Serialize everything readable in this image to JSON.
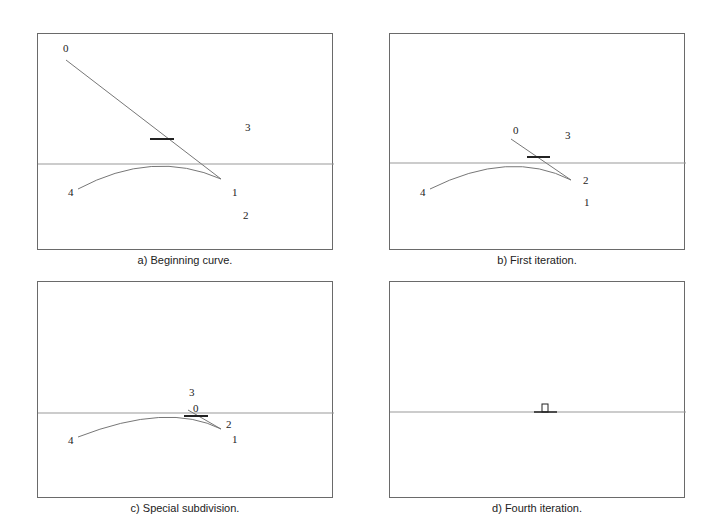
{
  "figure": {
    "panels": [
      {
        "id": "a",
        "caption": "a)  Beginning curve.",
        "labels": [
          {
            "text": "0",
            "x": 25,
            "y": 9
          },
          {
            "text": "3",
            "x": 207,
            "y": 88
          },
          {
            "text": "4",
            "x": 30,
            "y": 153
          },
          {
            "text": "1",
            "x": 194,
            "y": 153
          },
          {
            "text": "2",
            "x": 205,
            "y": 176
          }
        ]
      },
      {
        "id": "b",
        "caption": "b)  First iteration.",
        "labels": [
          {
            "text": "0",
            "x": 123,
            "y": 91
          },
          {
            "text": "3",
            "x": 175,
            "y": 96
          },
          {
            "text": "2",
            "x": 193,
            "y": 141
          },
          {
            "text": "4",
            "x": 30,
            "y": 153
          },
          {
            "text": "1",
            "x": 194,
            "y": 163
          }
        ]
      },
      {
        "id": "c",
        "caption": "c)  Special subdivision.",
        "labels": [
          {
            "text": "3",
            "x": 151,
            "y": 105
          },
          {
            "text": "0",
            "x": 155,
            "y": 121
          },
          {
            "text": "2",
            "x": 188,
            "y": 137
          },
          {
            "text": "4",
            "x": 30,
            "y": 153
          },
          {
            "text": "1",
            "x": 194,
            "y": 152
          }
        ]
      },
      {
        "id": "d",
        "caption": "d) Fourth iteration.",
        "labels": []
      }
    ],
    "colors": {
      "frame": "#6a6a6a",
      "axis": "#999999",
      "curve": "#777777",
      "marker": "#222222",
      "text": "#222222"
    }
  }
}
